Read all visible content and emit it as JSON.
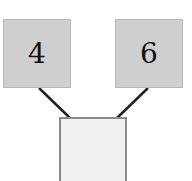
{
  "diagram": {
    "type": "number-bond",
    "parts": [
      {
        "label": "4",
        "position": "top-left"
      },
      {
        "label": "6",
        "position": "top-right"
      }
    ],
    "whole": {
      "label": "",
      "position": "bottom-center"
    },
    "colors": {
      "part_fill": "#cfcfcf",
      "whole_fill": "#f1f1f1",
      "line": "#222222"
    }
  }
}
